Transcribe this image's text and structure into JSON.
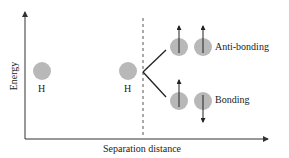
{
  "diagram": {
    "y_axis_label": "Energy",
    "x_axis_label": "Separation distance",
    "atoms": [
      {
        "label": "H"
      },
      {
        "label": "H"
      }
    ],
    "levels": [
      {
        "label": "Anti-bonding",
        "spins": [
          "up",
          "up"
        ]
      },
      {
        "label": "Bonding",
        "spins": [
          "up",
          "down"
        ]
      }
    ],
    "colors": {
      "orbital": "#b8b8b8",
      "line": "#222222",
      "axis": "#333333"
    }
  }
}
